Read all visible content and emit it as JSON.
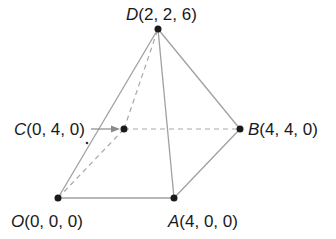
{
  "diagram": {
    "type": "pyramid",
    "colors": {
      "edge": "#9a9a9a",
      "point": "#1a1a1a",
      "text": "#1a1a1a"
    },
    "points": [
      {
        "name": "D",
        "coords": "(2, 2, 6)",
        "px": [
          158,
          29
        ]
      },
      {
        "name": "C",
        "coords": "(0, 4, 0)",
        "px": [
          124,
          129
        ]
      },
      {
        "name": "B",
        "coords": "(4, 4, 0)",
        "px": [
          240,
          129
        ]
      },
      {
        "name": "O",
        "coords": "(0, 0, 0)",
        "px": [
          58,
          198
        ]
      },
      {
        "name": "A",
        "coords": "(4, 0, 0)",
        "px": [
          174,
          198
        ]
      }
    ],
    "labels": {
      "D": {
        "var": "D",
        "coords": "(2, 2, 6)"
      },
      "C": {
        "var": "C",
        "coords": "(0, 4, 0)"
      },
      "B": {
        "var": "B",
        "coords": "(4, 4, 0)"
      },
      "O": {
        "var": "O",
        "coords": "(0, 0, 0)"
      },
      "A": {
        "var": "A",
        "coords": "(4, 0, 0)"
      }
    },
    "solid_edges": [
      [
        "O",
        "A"
      ],
      [
        "A",
        "B"
      ],
      [
        "O",
        "D"
      ],
      [
        "A",
        "D"
      ],
      [
        "B",
        "D"
      ]
    ],
    "dashed_edges": [
      [
        "O",
        "C"
      ],
      [
        "C",
        "B"
      ],
      [
        "C",
        "D"
      ]
    ],
    "arrow": {
      "from_label": "C",
      "to_point": "C"
    }
  }
}
